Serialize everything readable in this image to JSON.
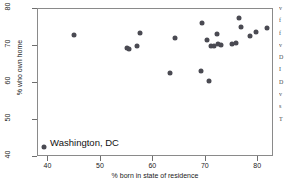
{
  "chart_data": {
    "type": "scatter",
    "title": "",
    "xlabel": "% born in state of residence",
    "ylabel": "% who own home",
    "xlim": [
      38,
      83
    ],
    "ylim": [
      40,
      80
    ],
    "xticks": [
      40,
      50,
      60,
      70,
      80
    ],
    "yticks": [
      40,
      50,
      60,
      70,
      80
    ],
    "grid": false,
    "legend": "none",
    "marker_color": "#4a4a52",
    "annotations": [
      {
        "text": "Washington, DC",
        "x": 40.5,
        "y": 43.5
      }
    ],
    "points": [
      {
        "x": 39.4,
        "y": 42.4,
        "label": "Washington, DC"
      },
      {
        "x": 45.0,
        "y": 72.7
      },
      {
        "x": 55.2,
        "y": 69.2
      },
      {
        "x": 55.5,
        "y": 69.0
      },
      {
        "x": 57.0,
        "y": 69.8
      },
      {
        "x": 57.6,
        "y": 73.2
      },
      {
        "x": 63.4,
        "y": 62.3
      },
      {
        "x": 64.3,
        "y": 71.8
      },
      {
        "x": 69.2,
        "y": 63.0
      },
      {
        "x": 69.4,
        "y": 76.0
      },
      {
        "x": 70.5,
        "y": 71.4
      },
      {
        "x": 70.8,
        "y": 60.3
      },
      {
        "x": 71.2,
        "y": 69.7
      },
      {
        "x": 71.8,
        "y": 69.8
      },
      {
        "x": 72.3,
        "y": 73.0
      },
      {
        "x": 72.5,
        "y": 70.2
      },
      {
        "x": 73.0,
        "y": 70.1
      },
      {
        "x": 75.2,
        "y": 70.2
      },
      {
        "x": 75.9,
        "y": 70.6
      },
      {
        "x": 76.6,
        "y": 77.4
      },
      {
        "x": 76.9,
        "y": 74.8
      },
      {
        "x": 78.6,
        "y": 72.5
      },
      {
        "x": 79.7,
        "y": 73.4
      },
      {
        "x": 81.8,
        "y": 74.5
      }
    ]
  },
  "margin_text": {
    "lines": [
      "v",
      "f",
      "f",
      "v",
      "D",
      "I",
      "D",
      "v",
      "s",
      "T"
    ]
  }
}
